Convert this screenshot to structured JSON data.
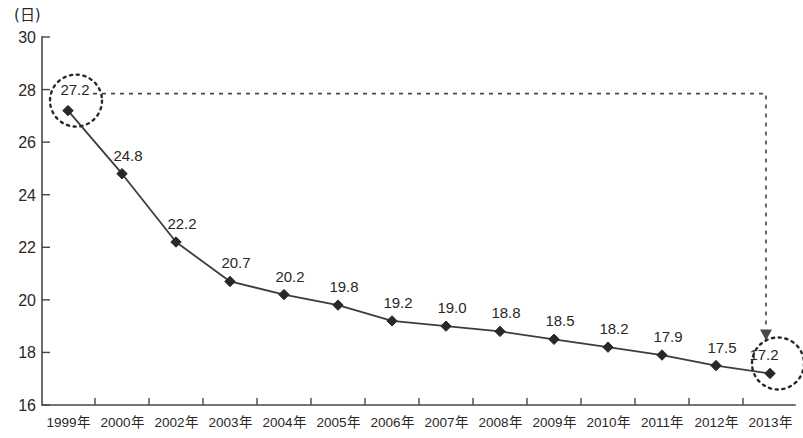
{
  "chart_data": {
    "type": "line",
    "title": "",
    "subtitle": "",
    "xlabel": "",
    "ylabel": "(日)",
    "ylim": [
      16,
      30
    ],
    "ytick_step": 2,
    "ytick_labels": [
      "30",
      "28",
      "26",
      "24",
      "22",
      "20",
      "18",
      "16"
    ],
    "grid": false,
    "legend": null,
    "categories": [
      "1999年",
      "2000年",
      "2002年",
      "2003年",
      "2004年",
      "2005年",
      "2006年",
      "2007年",
      "2008年",
      "2009年",
      "2010年",
      "2011年",
      "2012年",
      "2013年"
    ],
    "values": [
      27.2,
      24.8,
      22.2,
      20.7,
      20.2,
      19.8,
      19.2,
      19.0,
      18.8,
      18.5,
      18.2,
      17.9,
      17.5,
      17.2
    ],
    "point_labels": [
      "27.2",
      "24.8",
      "22.2",
      "20.7",
      "20.2",
      "19.8",
      "19.2",
      "19.0",
      "18.8",
      "18.5",
      "18.2",
      "17.9",
      "17.5",
      "17.2"
    ],
    "annotations": [
      {
        "name": "highlight-first-point",
        "kind": "dotted-circle",
        "target_category": "1999年",
        "target_value": 27.2,
        "label": "27.2"
      },
      {
        "name": "highlight-last-point",
        "kind": "dotted-circle",
        "target_category": "2013年",
        "target_value": 17.2,
        "label": "17.2"
      },
      {
        "name": "comparison-arrow",
        "kind": "dashed-arrow",
        "from_category": "1999年",
        "to_category": "2013年",
        "from_value": 27.2,
        "to_value": 17.2,
        "label": ""
      }
    ],
    "colors": {
      "line": "#403b39",
      "marker": "#2b2726",
      "axis": "#4a4745",
      "annotation": "#2b2726",
      "background": "#ffffff"
    }
  }
}
